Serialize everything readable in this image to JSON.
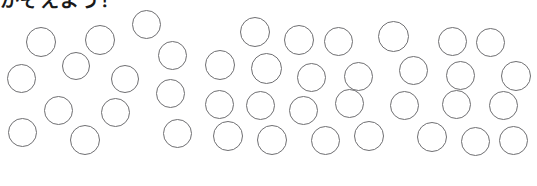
{
  "worksheet": {
    "heading": "かぞえよう！",
    "heading_note": "heading text is clipped at the top edge of the scan",
    "page_background": "#ffffff",
    "circle_stroke_color": "#6f6f72",
    "circle_fill": "none",
    "width": 537,
    "height": 186
  },
  "groups": [
    {
      "name": "left-group",
      "label": "",
      "count": 13,
      "circles": [
        {
          "cx": 41,
          "cy": 42,
          "d": 30
        },
        {
          "cx": 100,
          "cy": 40,
          "d": 30
        },
        {
          "cx": 146,
          "cy": 24,
          "d": 29
        },
        {
          "cx": 76,
          "cy": 66,
          "d": 28
        },
        {
          "cx": 21,
          "cy": 78,
          "d": 29
        },
        {
          "cx": 125,
          "cy": 79,
          "d": 28
        },
        {
          "cx": 172,
          "cy": 55,
          "d": 29
        },
        {
          "cx": 170,
          "cy": 93,
          "d": 29
        },
        {
          "cx": 58,
          "cy": 110,
          "d": 29
        },
        {
          "cx": 115,
          "cy": 112,
          "d": 29
        },
        {
          "cx": 22,
          "cy": 132,
          "d": 29
        },
        {
          "cx": 85,
          "cy": 140,
          "d": 30
        },
        {
          "cx": 177,
          "cy": 133,
          "d": 29
        }
      ]
    },
    {
      "name": "right-group",
      "label": "",
      "count": 27,
      "circles": [
        {
          "cx": 255,
          "cy": 32,
          "d": 30
        },
        {
          "cx": 299,
          "cy": 40,
          "d": 30
        },
        {
          "cx": 338,
          "cy": 41,
          "d": 29
        },
        {
          "cx": 393,
          "cy": 36,
          "d": 31
        },
        {
          "cx": 452,
          "cy": 41,
          "d": 29
        },
        {
          "cx": 490,
          "cy": 42,
          "d": 29
        },
        {
          "cx": 220,
          "cy": 65,
          "d": 30
        },
        {
          "cx": 266,
          "cy": 68,
          "d": 31
        },
        {
          "cx": 311,
          "cy": 77,
          "d": 29
        },
        {
          "cx": 358,
          "cy": 76,
          "d": 29
        },
        {
          "cx": 413,
          "cy": 70,
          "d": 29
        },
        {
          "cx": 460,
          "cy": 75,
          "d": 29
        },
        {
          "cx": 516,
          "cy": 76,
          "d": 30
        },
        {
          "cx": 219,
          "cy": 104,
          "d": 29
        },
        {
          "cx": 260,
          "cy": 105,
          "d": 29
        },
        {
          "cx": 303,
          "cy": 110,
          "d": 29
        },
        {
          "cx": 349,
          "cy": 103,
          "d": 29
        },
        {
          "cx": 404,
          "cy": 105,
          "d": 29
        },
        {
          "cx": 503,
          "cy": 105,
          "d": 29
        },
        {
          "cx": 228,
          "cy": 136,
          "d": 30
        },
        {
          "cx": 272,
          "cy": 140,
          "d": 30
        },
        {
          "cx": 325,
          "cy": 140,
          "d": 29
        },
        {
          "cx": 369,
          "cy": 136,
          "d": 30
        },
        {
          "cx": 432,
          "cy": 137,
          "d": 30
        },
        {
          "cx": 475,
          "cy": 141,
          "d": 29
        },
        {
          "cx": 513,
          "cy": 140,
          "d": 29
        },
        {
          "cx": 456,
          "cy": 104,
          "d": 29
        }
      ]
    }
  ]
}
